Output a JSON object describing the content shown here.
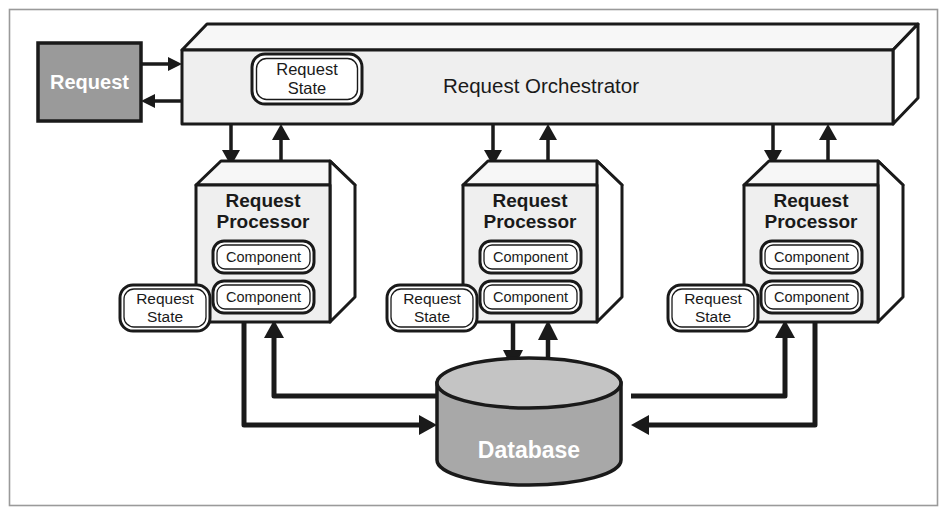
{
  "diagram": {
    "frame": {
      "border_color": "#9a9a9a"
    },
    "colors": {
      "stroke": "#1a1a1a",
      "box_face": "#efefef",
      "box_top": "#f7f7f7",
      "box_side": "#ffffff",
      "request_fill": "#9a9a9a",
      "database_body": "#a8a8a8",
      "database_top": "#c4c4c4",
      "text_dark": "#1a1a1a",
      "text_light": "#ffffff"
    },
    "request": {
      "label": "Request"
    },
    "orchestrator": {
      "label": "Request Orchestrator",
      "state_pill": "Request State",
      "state_pill_line1": "Request",
      "state_pill_line2": "State"
    },
    "processors": [
      {
        "title_line1": "Request",
        "title_line2": "Processor",
        "components": [
          "Component",
          "Component"
        ],
        "state_pill_line1": "Request",
        "state_pill_line2": "State"
      },
      {
        "title_line1": "Request",
        "title_line2": "Processor",
        "components": [
          "Component",
          "Component"
        ],
        "state_pill_line1": "Request",
        "state_pill_line2": "State"
      },
      {
        "title_line1": "Request",
        "title_line2": "Processor",
        "components": [
          "Component",
          "Component"
        ],
        "state_pill_line1": "Request",
        "state_pill_line2": "State"
      }
    ],
    "database": {
      "label": "Database"
    },
    "connections": [
      {
        "from": "request",
        "to": "orchestrator",
        "direction": "right"
      },
      {
        "from": "orchestrator",
        "to": "request",
        "direction": "left"
      },
      {
        "from": "orchestrator",
        "to": "processor-1",
        "direction": "down"
      },
      {
        "from": "processor-1",
        "to": "orchestrator",
        "direction": "up"
      },
      {
        "from": "orchestrator",
        "to": "processor-2",
        "direction": "down"
      },
      {
        "from": "processor-2",
        "to": "orchestrator",
        "direction": "up"
      },
      {
        "from": "orchestrator",
        "to": "processor-3",
        "direction": "down"
      },
      {
        "from": "processor-3",
        "to": "orchestrator",
        "direction": "up"
      },
      {
        "from": "processor-1",
        "to": "database",
        "direction": "down-right"
      },
      {
        "from": "database",
        "to": "processor-1",
        "direction": "up-left"
      },
      {
        "from": "processor-2",
        "to": "database",
        "direction": "down"
      },
      {
        "from": "database",
        "to": "processor-2",
        "direction": "up"
      },
      {
        "from": "processor-3",
        "to": "database",
        "direction": "down-left"
      },
      {
        "from": "database",
        "to": "processor-3",
        "direction": "up-right"
      }
    ]
  }
}
